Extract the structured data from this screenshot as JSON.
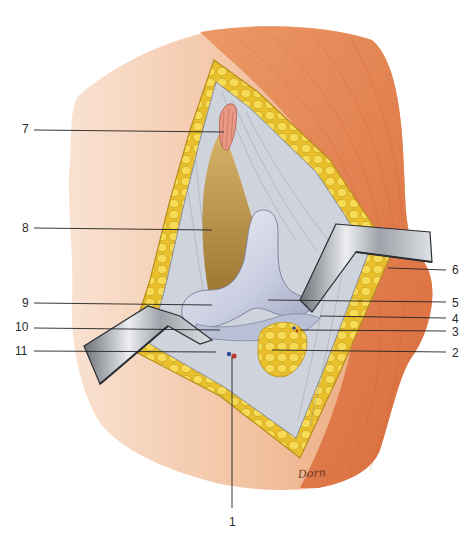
{
  "figure": {
    "type": "anatomical-illustration",
    "signature": "Dorn",
    "colors": {
      "background": "#ffffff",
      "skin_light": "#f7d9c4",
      "skin_mid": "#f0b892",
      "muscle": "#e8814f",
      "muscle_dark": "#d9693a",
      "fat": "#f2cf3a",
      "fat_shadow": "#c9a21e",
      "fascia": "#cfd3dc",
      "bone": "#c9cde0",
      "bone_highlight": "#eef0f7",
      "deep_tissue": "#b88c3a",
      "retractor": "#a8acb3",
      "retractor_dark": "#3e4146",
      "artery": "#c0392b",
      "vein": "#2f4f9e",
      "leader_line": "#222222"
    }
  },
  "labels": [
    {
      "id": "1",
      "text": "1",
      "x": 229,
      "y": 516,
      "line": {
        "x1": 232,
        "y1": 508,
        "x2": 232,
        "y2": 357
      }
    },
    {
      "id": "2",
      "text": "2",
      "x": 452,
      "y": 347,
      "line": {
        "x1": 446,
        "y1": 352,
        "x2": 272,
        "y2": 350
      }
    },
    {
      "id": "3",
      "text": "3",
      "x": 452,
      "y": 326,
      "line": {
        "x1": 446,
        "y1": 331,
        "x2": 300,
        "y2": 330
      }
    },
    {
      "id": "4",
      "text": "4",
      "x": 452,
      "y": 313,
      "line": {
        "x1": 446,
        "y1": 318,
        "x2": 320,
        "y2": 316
      }
    },
    {
      "id": "5",
      "text": "5",
      "x": 452,
      "y": 297,
      "line": {
        "x1": 446,
        "y1": 302,
        "x2": 268,
        "y2": 300
      }
    },
    {
      "id": "6",
      "text": "6",
      "x": 452,
      "y": 264,
      "line": {
        "x1": 446,
        "y1": 270,
        "x2": 388,
        "y2": 268
      }
    },
    {
      "id": "7",
      "text": "7",
      "x": 22,
      "y": 123,
      "line": {
        "x1": 34,
        "y1": 130,
        "x2": 224,
        "y2": 132
      }
    },
    {
      "id": "8",
      "text": "8",
      "x": 22,
      "y": 222,
      "line": {
        "x1": 34,
        "y1": 228,
        "x2": 212,
        "y2": 230
      }
    },
    {
      "id": "9",
      "text": "9",
      "x": 22,
      "y": 297,
      "line": {
        "x1": 34,
        "y1": 303,
        "x2": 212,
        "y2": 305
      }
    },
    {
      "id": "10",
      "text": "10",
      "x": 15,
      "y": 321,
      "line": {
        "x1": 34,
        "y1": 328,
        "x2": 220,
        "y2": 330
      }
    },
    {
      "id": "11",
      "text": "11",
      "x": 15,
      "y": 345,
      "line": {
        "x1": 34,
        "y1": 351,
        "x2": 216,
        "y2": 352
      }
    }
  ]
}
